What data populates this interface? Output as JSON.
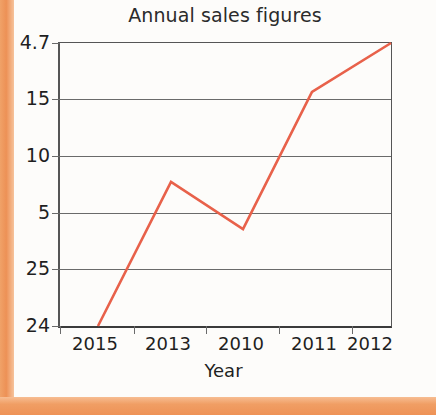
{
  "chart_data": {
    "type": "line",
    "title": "Annual sales figures",
    "xlabel": "Year",
    "ylabel": "",
    "categories": [
      "2015",
      "2013",
      "2010",
      "2011",
      "2012"
    ],
    "ytick_labels": [
      "4.7",
      "15",
      "10",
      "5",
      "25",
      "24"
    ],
    "values": [
      24,
      8.8,
      4.2,
      15.6,
      47
    ],
    "series": [
      {
        "name": "Annual sales",
        "color": "#e8614a",
        "values": [
          24,
          8.8,
          4.2,
          15.6,
          47
        ]
      }
    ],
    "points": [
      {
        "x": "2015",
        "px": 38,
        "py": 283
      },
      {
        "x": "2013",
        "px": 111,
        "py": 139
      },
      {
        "x": "2010",
        "px": 183,
        "py": 186
      },
      {
        "x": "2011",
        "px": 252,
        "py": 49
      },
      {
        "x": "2012",
        "px": 331,
        "py": 0
      }
    ],
    "gridline_positions": [
      0,
      56,
      113,
      170,
      226,
      283
    ],
    "xtick_positions": [
      0,
      74,
      146,
      219,
      292,
      331
    ],
    "grid": true,
    "legend": "none",
    "note": "Y axis tick labels are out of numeric order as printed in the source figure"
  },
  "chart": {
    "title": "Annual sales figures",
    "axis_x_name": "Year",
    "y_labels": [
      {
        "text": "4.7",
        "pos": 0
      },
      {
        "text": "15",
        "pos": 56
      },
      {
        "text": "10",
        "pos": 113
      },
      {
        "text": "5",
        "pos": 170
      },
      {
        "text": "25",
        "pos": 226
      },
      {
        "text": "24",
        "pos": 283
      }
    ],
    "x_labels": [
      {
        "text": "2015",
        "pos": 37
      },
      {
        "text": "2013",
        "pos": 110
      },
      {
        "text": "2010",
        "pos": 183
      },
      {
        "text": "2011",
        "pos": 256
      },
      {
        "text": "2012",
        "pos": 312
      }
    ],
    "line_points": "38,283 111,139 183,186 252,49 331,0",
    "line_color": "#e8614a"
  }
}
